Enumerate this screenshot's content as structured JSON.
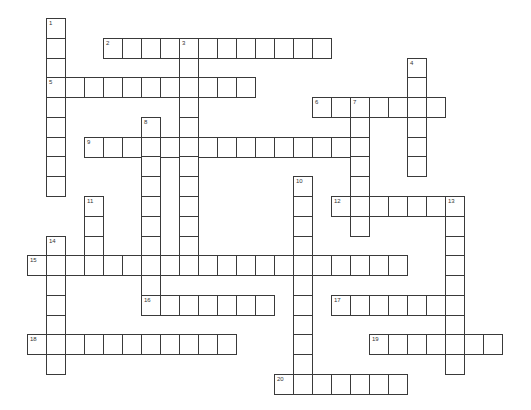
{
  "puzzle": {
    "type": "crossword",
    "grid": {
      "origin_x": 27,
      "origin_y": 18,
      "cell_w": 19,
      "cell_h": 19.78,
      "border_color": "#3a3a3a",
      "fill_color": "#ffffff"
    },
    "entries": [
      {
        "number": "1",
        "direction": "down",
        "col": 1,
        "row": 0,
        "length": 9
      },
      {
        "number": "2",
        "direction": "across",
        "col": 4,
        "row": 1,
        "length": 12
      },
      {
        "number": "3",
        "direction": "down",
        "col": 8,
        "row": 1,
        "length": 12
      },
      {
        "number": "4",
        "direction": "down",
        "col": 20,
        "row": 2,
        "length": 6
      },
      {
        "number": "5",
        "direction": "across",
        "col": 1,
        "row": 3,
        "length": 11
      },
      {
        "number": "6",
        "direction": "across",
        "col": 15,
        "row": 4,
        "length": 7
      },
      {
        "number": "7",
        "direction": "down",
        "col": 17,
        "row": 4,
        "length": 7
      },
      {
        "number": "8",
        "direction": "down",
        "col": 6,
        "row": 5,
        "length": 10
      },
      {
        "number": "9",
        "direction": "across",
        "col": 3,
        "row": 6,
        "length": 15
      },
      {
        "number": "10",
        "direction": "down",
        "col": 14,
        "row": 8,
        "length": 11
      },
      {
        "number": "11",
        "direction": "down",
        "col": 3,
        "row": 9,
        "length": 4
      },
      {
        "number": "12",
        "direction": "across",
        "col": 16,
        "row": 9,
        "length": 7
      },
      {
        "number": "13",
        "direction": "down",
        "col": 22,
        "row": 9,
        "length": 9
      },
      {
        "number": "14",
        "direction": "down",
        "col": 1,
        "row": 11,
        "length": 7
      },
      {
        "number": "15",
        "direction": "across",
        "col": 0,
        "row": 12,
        "length": 20
      },
      {
        "number": "16",
        "direction": "across",
        "col": 6,
        "row": 14,
        "length": 7
      },
      {
        "number": "17",
        "direction": "across",
        "col": 16,
        "row": 14,
        "length": 7
      },
      {
        "number": "18",
        "direction": "across",
        "col": 0,
        "row": 16,
        "length": 11
      },
      {
        "number": "19",
        "direction": "across",
        "col": 18,
        "row": 16,
        "length": 7
      },
      {
        "number": "20",
        "direction": "across",
        "col": 13,
        "row": 18,
        "length": 7
      }
    ]
  }
}
